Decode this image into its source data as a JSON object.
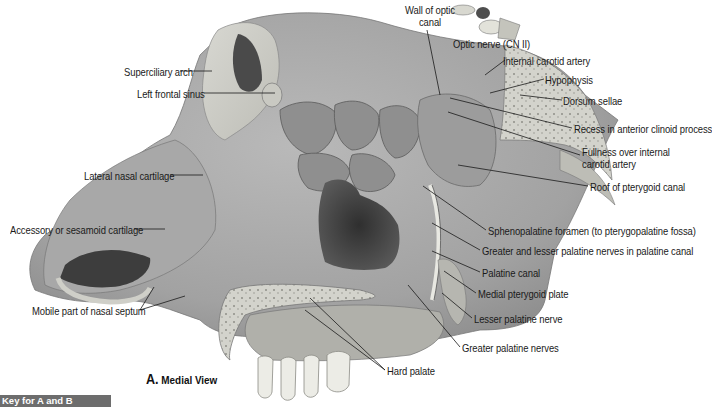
{
  "figure": {
    "view_title_letter": "A.",
    "view_title_text": "Medial View",
    "key_bar": "Key for A and B"
  },
  "labels": {
    "wall_of_optic_canal_1": "Wall of optic",
    "wall_of_optic_canal_2": "canal",
    "optic_nerve": "Optic nerve (CN II)",
    "internal_carotid_artery": "Internal carotid artery",
    "hypophysis": "Hypophysis",
    "dorsum_sellae": "Dorsum sellae",
    "recess_anterior_clinoid": "Recess in anterior clinoid process",
    "fullness_1": "Fullness over internal",
    "fullness_2": "carotid artery",
    "roof_pterygoid_canal": "Roof of pterygoid canal",
    "sphenopalatine_foramen": "Sphenopalatine foramen (to pterygopalatine fossa)",
    "greater_lesser_palatine_nerves": "Greater and lesser palatine nerves in palatine canal",
    "palatine_canal": "Palatine canal",
    "medial_pterygoid_plate": "Medial pterygoid plate",
    "lesser_palatine_nerve": "Lesser palatine nerve",
    "greater_palatine_nerves": "Greater palatine nerves",
    "hard_palate": "Hard palate",
    "superciliary_arch": "Superciliary arch",
    "left_frontal_sinus": "Left frontal sinus",
    "lateral_nasal_cartilage": "Lateral nasal cartilage",
    "accessory_sesamoid_cartilage": "Accessory or sesamoid cartilage",
    "mobile_part_nasal_septum": "Mobile part of nasal septum"
  },
  "colors": {
    "key_bar_bg": "#6d6d6d",
    "label_text": "#1a1a1a"
  }
}
